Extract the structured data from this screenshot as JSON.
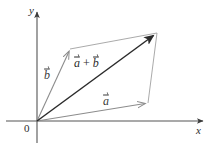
{
  "figure": {
    "background": "#ffffff",
    "width": 216,
    "height": 147
  },
  "axes": {
    "origin_label": "0",
    "x_label": "x",
    "y_label": "y",
    "axis_color": "#555555",
    "origin_px": [
      37,
      121
    ],
    "x_axis_end_px": [
      205,
      121
    ],
    "y_axis_end_px": [
      37,
      10
    ]
  },
  "vectors": [
    {
      "name": "a",
      "label": "a",
      "color": "#8c8c8c",
      "from_px": [
        37,
        121
      ],
      "to_px": [
        148,
        103
      ],
      "style": "solid",
      "head": "open"
    },
    {
      "name": "b",
      "label": "b",
      "color": "#8c8c8c",
      "from_px": [
        37,
        121
      ],
      "to_px": [
        70,
        49
      ],
      "style": "solid",
      "head": "open"
    },
    {
      "name": "a-plus-b",
      "label": "a + b",
      "color": "#2b2b2b",
      "from_px": [
        37,
        121
      ],
      "to_px": [
        157,
        33
      ],
      "style": "solid",
      "head": "filled"
    }
  ],
  "parallelogram": {
    "color": "#9a9a9a",
    "vertices_px": [
      [
        37,
        121
      ],
      [
        148,
        103
      ],
      [
        157,
        33
      ],
      [
        70,
        49
      ]
    ],
    "side_top_from_px": [
      70,
      49
    ],
    "side_top_to_px": [
      157,
      33
    ],
    "side_right_from_px": [
      148,
      103
    ],
    "side_right_to_px": [
      157,
      33
    ]
  },
  "labels": {
    "vec_a": "a",
    "vec_b": "b",
    "sum_a": "a",
    "sum_plus": "+",
    "sum_b": "b",
    "origin": "0",
    "axis_x": "x",
    "axis_y": "y"
  }
}
